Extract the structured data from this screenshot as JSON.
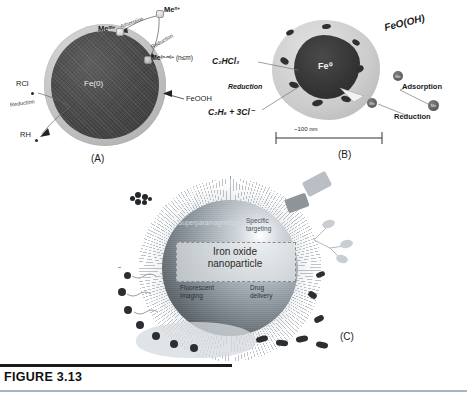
{
  "figure": {
    "caption_id": "FIGURE 3.13",
    "accent_color": "#a8b6bd",
    "rule_color": "#1a1a1a"
  },
  "panel_a": {
    "panel_label": "(A)",
    "core_label": "Fe(0)",
    "shell_label": "FeOOH",
    "species_metal_n": "Me",
    "species_metal_n_sup": "n+",
    "species_metal_m": "Me",
    "species_metal_m_sup": "m+",
    "species_metal_reduced": "Me",
    "species_metal_reduced_sup": "(n-m)+",
    "species_metal_reduced_note": "(n≤m)",
    "process_adsorption": "Adsorption",
    "process_reduction_top": "Reduction",
    "process_reduction_left": "Reduction",
    "reactant_left": "RCl",
    "product_left": "RH",
    "colors": {
      "core": "#3f3f3f",
      "shell": "#c2c2c2"
    }
  },
  "panel_b": {
    "panel_label": "(B)",
    "core_label": "Fe⁰",
    "oxide_label": "FeO(OH)",
    "reactant": "C₂HCl₃",
    "process_reduction_left": "Reduction",
    "product": "C₂H₆ + 3Cl⁻",
    "process_adsorption": "Adsorption",
    "process_reduction_right": "Reduction",
    "scale_bar": "~100 nm",
    "metal_tag": "Me",
    "colors": {
      "core": "#343434",
      "oxide_shell": "#cbcbcb"
    }
  },
  "panel_c": {
    "panel_label": "(C)",
    "center_label_line1": "Iron oxide",
    "center_label_line2": "nanoparticle",
    "quadrant_top_left": "Superparamagnetism",
    "quadrant_top_right_line1": "Specific",
    "quadrant_top_right_line2": "targeting",
    "quadrant_bottom_left_line1": "Fluorescent",
    "quadrant_bottom_left_line2": "imaging",
    "quadrant_bottom_right_line1": "Drug",
    "quadrant_bottom_right_line2": "delivery",
    "colors": {
      "sphere_highlight": "#ffffff",
      "sphere_mid": "#8d979f",
      "sphere_shadow": "#3f464b",
      "halo": "#dfe3e6"
    }
  }
}
